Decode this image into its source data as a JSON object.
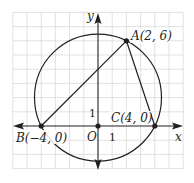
{
  "diagram": {
    "type": "coordinate-geometry",
    "axes": {
      "x_label": "x",
      "y_label": "y",
      "origin_label": "O",
      "x_tick_label": "1",
      "y_tick_label": "1"
    },
    "grid": {
      "x_range": [
        -6,
        6
      ],
      "y_range": [
        -3,
        8
      ]
    },
    "points": [
      {
        "name": "A",
        "label": "A(2, 6)",
        "x": 2,
        "y": 6
      },
      {
        "name": "B",
        "label": "B(−4, 0)",
        "x": -4,
        "y": 0
      },
      {
        "name": "C",
        "label": "C(4, 0)",
        "x": 4,
        "y": 0
      },
      {
        "name": "O",
        "label": "O",
        "x": 0,
        "y": 0
      }
    ],
    "circle": {
      "center": [
        0,
        2
      ],
      "radius_squared": 20
    },
    "segments": [
      [
        "B",
        "A"
      ],
      [
        "A",
        "C"
      ]
    ],
    "colors": {
      "line": "#231f20",
      "grid": "#d9d9d9"
    }
  }
}
